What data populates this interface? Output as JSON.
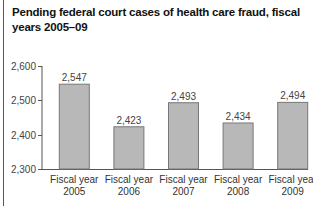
{
  "title": "Pending federal court cases of health care fraud, fiscal years 2005–09",
  "colors": {
    "bar": "#b8b8b8",
    "bar_edge": "#777777",
    "axis": "#555555"
  },
  "chart_data": {
    "type": "bar",
    "title": "Pending federal court cases of health care fraud, fiscal years 2005–09",
    "categories": [
      "Fiscal year 2005",
      "Fiscal year 2006",
      "Fiscal year 2007",
      "Fiscal year 2008",
      "Fiscal year 2009"
    ],
    "category_lines": [
      [
        "Fiscal year",
        "2005"
      ],
      [
        "Fiscal year",
        "2006"
      ],
      [
        "Fiscal year",
        "2007"
      ],
      [
        "Fiscal year",
        "2008"
      ],
      [
        "Fiscal year",
        "2009"
      ]
    ],
    "values": [
      2547,
      2423,
      2493,
      2434,
      2494
    ],
    "value_labels": [
      "2,547",
      "2,423",
      "2,493",
      "2,434",
      "2,494"
    ],
    "xlabel": "",
    "ylabel": "",
    "ylim": [
      2300,
      2600
    ],
    "yticks": [
      2300,
      2400,
      2500,
      2600
    ],
    "ytick_labels": [
      "2,300",
      "2,400",
      "2,500",
      "2,600"
    ],
    "grid": false,
    "legend": null
  }
}
